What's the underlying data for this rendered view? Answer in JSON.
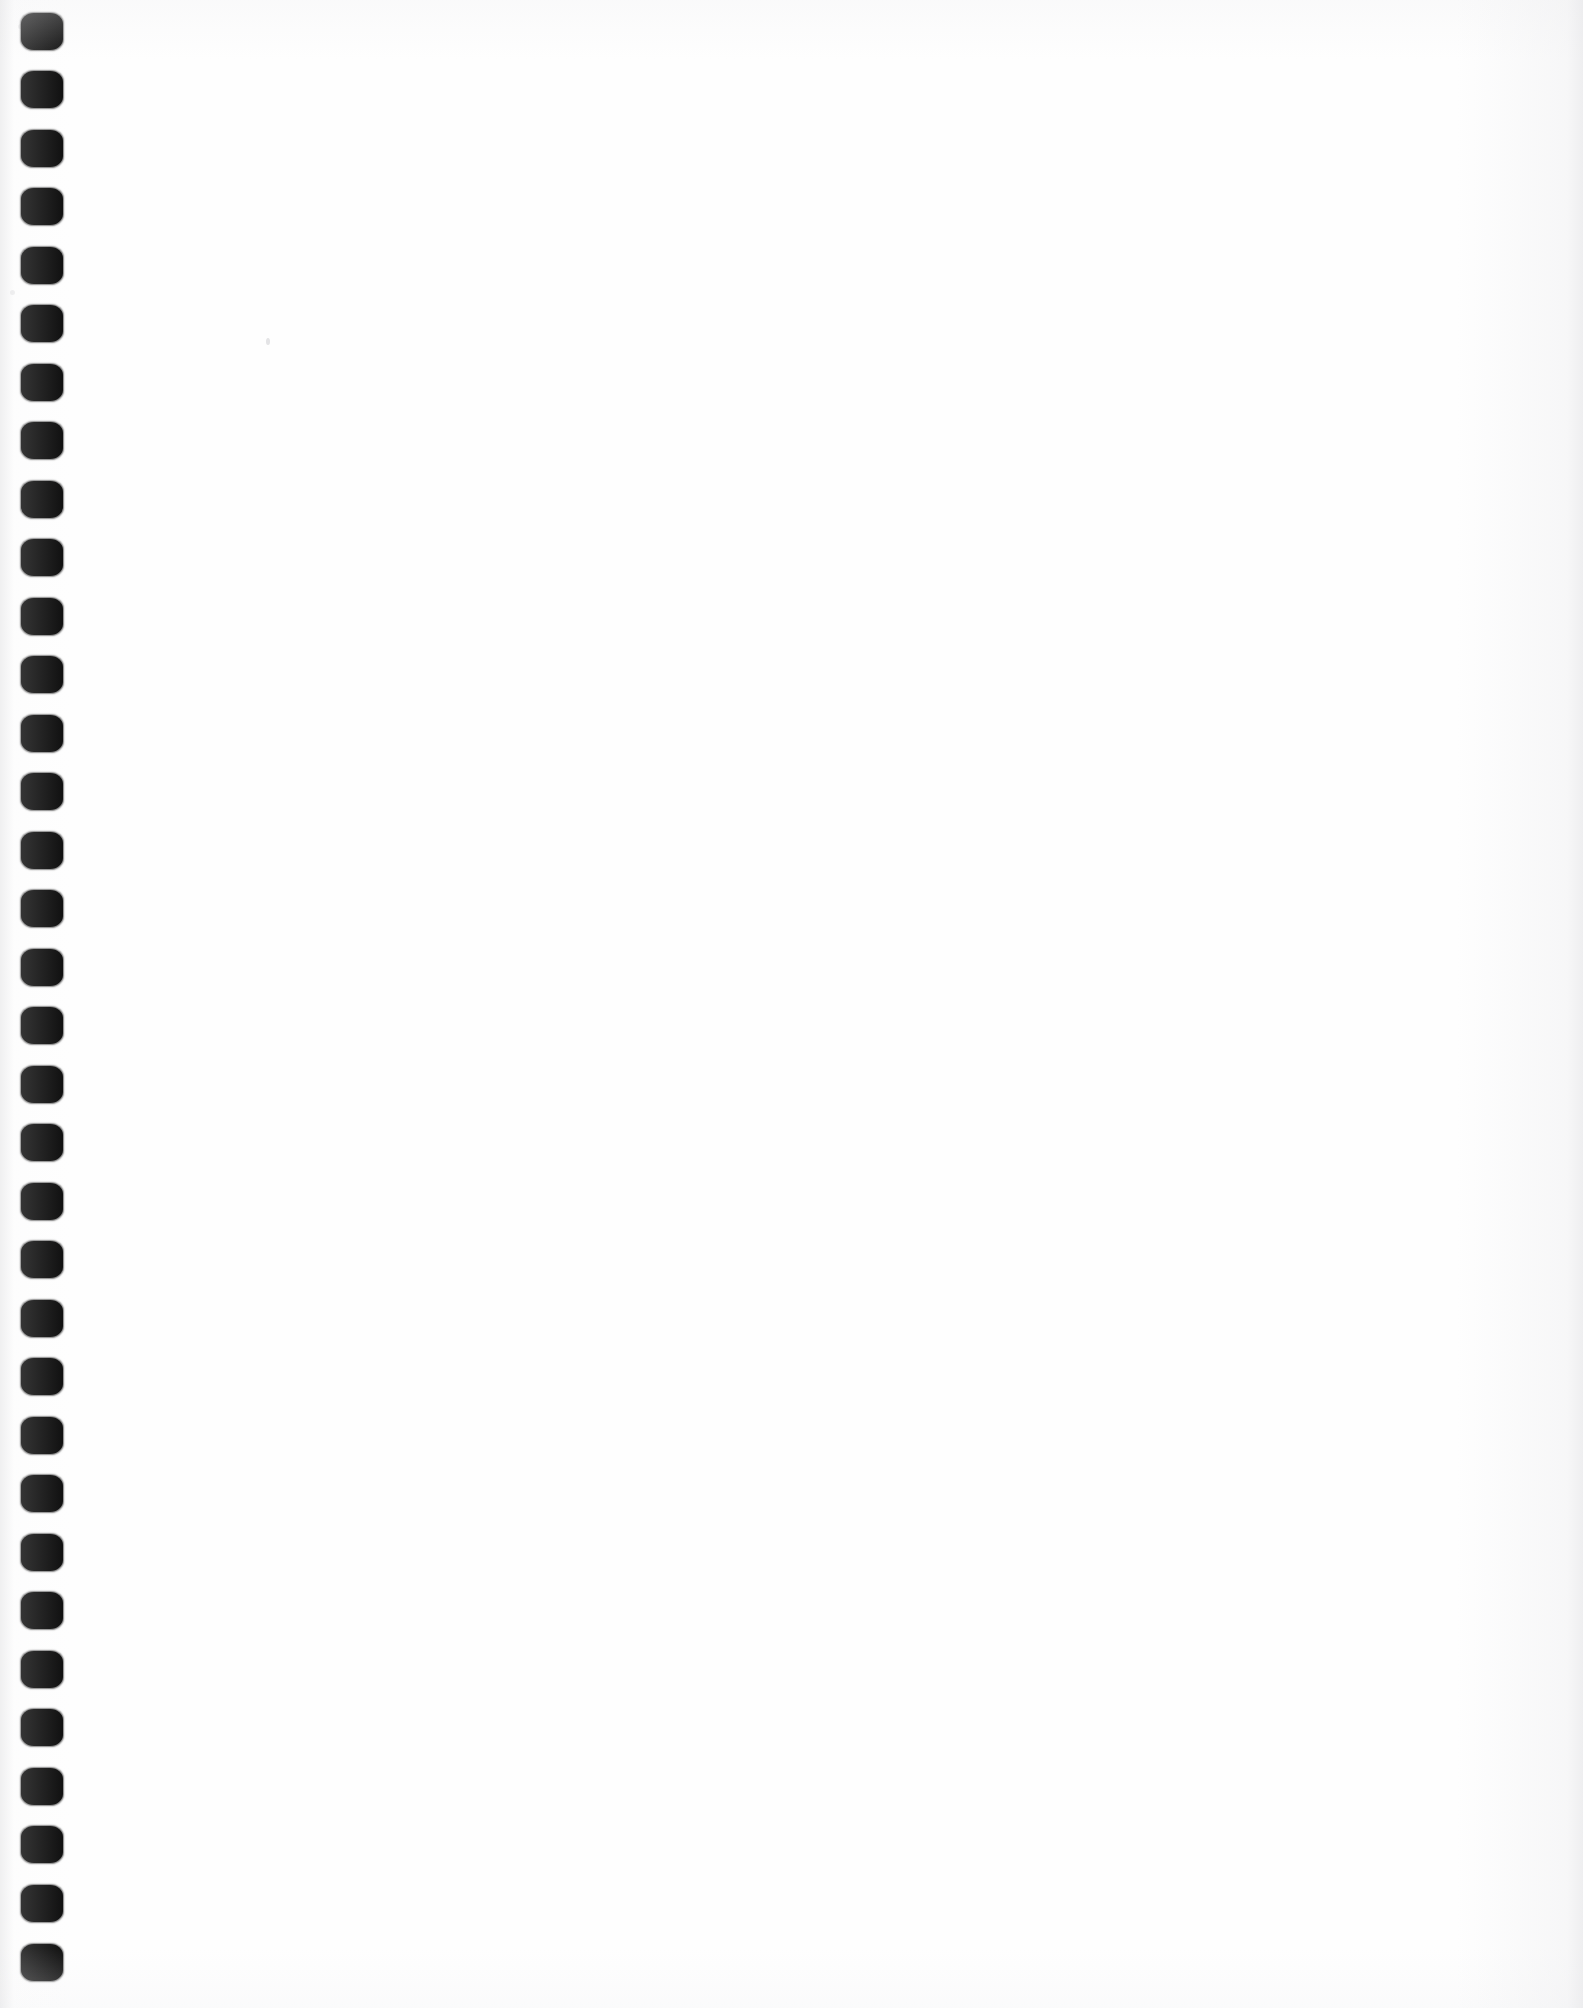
{
  "document": {
    "kind": "scanned-page",
    "page_content": "",
    "page_text_lines": [],
    "annotations": [],
    "note": ""
  },
  "canvas": {
    "width": 1583,
    "height": 2008,
    "background_color": "#fefefe",
    "page_color": "#ffffff"
  },
  "binding": {
    "type": "punched-binding-holes",
    "edge": "left",
    "hole_color": "#0b0b0b",
    "hole_count": 34,
    "hole_width": 42,
    "hole_height": 37,
    "hole_left": 21,
    "hole_corner_radius": 13,
    "first_hole_center_y": 31,
    "hole_spacing": 58.6,
    "holes": [
      {
        "index": 1,
        "x": 21,
        "y": 13,
        "w": 42,
        "h": 37
      },
      {
        "index": 2,
        "x": 21,
        "y": 71,
        "w": 42,
        "h": 37
      },
      {
        "index": 3,
        "x": 21,
        "y": 130,
        "w": 42,
        "h": 37
      },
      {
        "index": 4,
        "x": 21,
        "y": 188,
        "w": 42,
        "h": 37
      },
      {
        "index": 5,
        "x": 21,
        "y": 247,
        "w": 42,
        "h": 37
      },
      {
        "index": 6,
        "x": 21,
        "y": 305,
        "w": 42,
        "h": 37
      },
      {
        "index": 7,
        "x": 21,
        "y": 364,
        "w": 42,
        "h": 37
      },
      {
        "index": 8,
        "x": 21,
        "y": 422,
        "w": 42,
        "h": 37
      },
      {
        "index": 9,
        "x": 21,
        "y": 481,
        "w": 42,
        "h": 37
      },
      {
        "index": 10,
        "x": 21,
        "y": 539,
        "w": 42,
        "h": 37
      },
      {
        "index": 11,
        "x": 21,
        "y": 598,
        "w": 42,
        "h": 37
      },
      {
        "index": 12,
        "x": 21,
        "y": 656,
        "w": 42,
        "h": 37
      },
      {
        "index": 13,
        "x": 21,
        "y": 715,
        "w": 42,
        "h": 37
      },
      {
        "index": 14,
        "x": 21,
        "y": 773,
        "w": 42,
        "h": 37
      },
      {
        "index": 15,
        "x": 21,
        "y": 832,
        "w": 42,
        "h": 37
      },
      {
        "index": 16,
        "x": 21,
        "y": 890,
        "w": 42,
        "h": 37
      },
      {
        "index": 17,
        "x": 21,
        "y": 949,
        "w": 42,
        "h": 37
      },
      {
        "index": 18,
        "x": 21,
        "y": 1007,
        "w": 42,
        "h": 37
      },
      {
        "index": 19,
        "x": 21,
        "y": 1066,
        "w": 42,
        "h": 37
      },
      {
        "index": 20,
        "x": 21,
        "y": 1124,
        "w": 42,
        "h": 37
      },
      {
        "index": 21,
        "x": 21,
        "y": 1183,
        "w": 42,
        "h": 37
      },
      {
        "index": 22,
        "x": 21,
        "y": 1241,
        "w": 42,
        "h": 37
      },
      {
        "index": 23,
        "x": 21,
        "y": 1300,
        "w": 42,
        "h": 37
      },
      {
        "index": 24,
        "x": 21,
        "y": 1358,
        "w": 42,
        "h": 37
      },
      {
        "index": 25,
        "x": 21,
        "y": 1417,
        "w": 42,
        "h": 37
      },
      {
        "index": 26,
        "x": 21,
        "y": 1475,
        "w": 42,
        "h": 37
      },
      {
        "index": 27,
        "x": 21,
        "y": 1534,
        "w": 42,
        "h": 37
      },
      {
        "index": 28,
        "x": 21,
        "y": 1592,
        "w": 42,
        "h": 37
      },
      {
        "index": 29,
        "x": 21,
        "y": 1651,
        "w": 42,
        "h": 37
      },
      {
        "index": 30,
        "x": 21,
        "y": 1709,
        "w": 42,
        "h": 37
      },
      {
        "index": 31,
        "x": 21,
        "y": 1768,
        "w": 42,
        "h": 37
      },
      {
        "index": 32,
        "x": 21,
        "y": 1826,
        "w": 42,
        "h": 37
      },
      {
        "index": 33,
        "x": 21,
        "y": 1885,
        "w": 42,
        "h": 37
      },
      {
        "index": 34,
        "x": 21,
        "y": 1944,
        "w": 42,
        "h": 37
      }
    ]
  },
  "artifacts": {
    "specks": [
      {
        "x": 266,
        "y": 338,
        "variant": "a"
      },
      {
        "x": 18,
        "y": 24,
        "variant": "b"
      },
      {
        "x": 10,
        "y": 290,
        "variant": "b"
      }
    ]
  }
}
